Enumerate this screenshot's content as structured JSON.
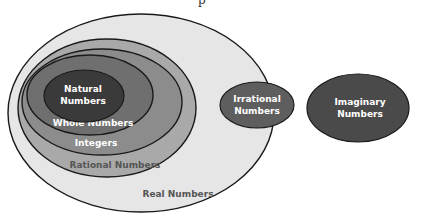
{
  "diagram": {
    "title_fragment": "p",
    "sets": {
      "real": {
        "label": "Real Numbers",
        "fill": "#e6e6e6"
      },
      "rational": {
        "label": "Rational Numbers",
        "fill": "#a9a9a9"
      },
      "integers": {
        "label": "Integers",
        "fill": "#8c8c8c"
      },
      "whole": {
        "label": "Whole Numbers",
        "fill": "#6f6f6f"
      },
      "natural": {
        "label_line1": "Natural",
        "label_line2": "Numbers",
        "fill": "#3a3a3a"
      },
      "irrational": {
        "label_line1": "Irrational",
        "label_line2": "Numbers",
        "fill": "#5e5e5e"
      },
      "imaginary": {
        "label_line1": "Imaginary",
        "label_line2": "Numbers",
        "fill": "#4a4a4a"
      }
    },
    "outline_color": "#1a1a1a"
  }
}
